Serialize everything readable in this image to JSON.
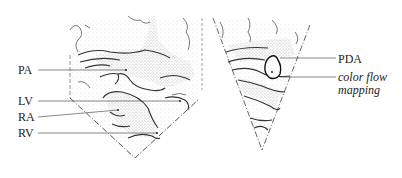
{
  "figure": {
    "left_panel": {
      "name": "left-echo-sector",
      "labels": [
        {
          "id": "pa",
          "text": "PA",
          "x": 18,
          "y": 64
        },
        {
          "id": "lv",
          "text": "LV",
          "x": 18,
          "y": 95
        },
        {
          "id": "ra",
          "text": "RA",
          "x": 18,
          "y": 111
        },
        {
          "id": "rv",
          "text": "RV",
          "x": 18,
          "y": 127
        }
      ]
    },
    "right_panel": {
      "name": "right-echo-sector",
      "labels": [
        {
          "id": "pda",
          "text": "PDA",
          "x": 338,
          "y": 53
        },
        {
          "id": "cfm1",
          "text": "color flow",
          "x": 338,
          "y": 72
        },
        {
          "id": "cfm2",
          "text": "mapping",
          "x": 338,
          "y": 85
        }
      ]
    },
    "colors": {
      "ink": "#333333",
      "stipple": "#9a9a9a",
      "background": "#ffffff"
    }
  }
}
